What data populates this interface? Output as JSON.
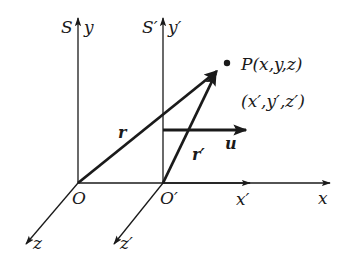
{
  "diagram": {
    "type": "reference-frames-relative-motion",
    "colors": {
      "stroke": "#1a1a1a",
      "background": "#ffffff"
    },
    "frames": {
      "S": {
        "label": "S",
        "y_axis_label": "y",
        "x_axis_label": "x",
        "z_axis_label": "z",
        "origin_label": "O"
      },
      "S_prime": {
        "label": "S′",
        "y_axis_label": "y′",
        "x_axis_label": "x′",
        "z_axis_label": "z′",
        "origin_label": "O′"
      }
    },
    "point": {
      "label": "P(x,y,z)",
      "primed_coords": "(x′,y′,z′)"
    },
    "vectors": {
      "r": {
        "label": "r"
      },
      "r_prime": {
        "label": "r′"
      },
      "u": {
        "label": "u"
      }
    }
  }
}
